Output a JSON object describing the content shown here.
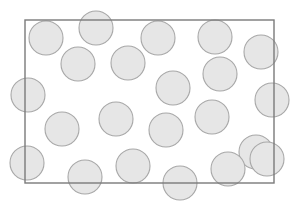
{
  "figure": {
    "name": "circle-field-with-rectangular-sampling-frame",
    "background_color": "#ffffff",
    "width": 299,
    "height": 204
  },
  "frame": {
    "label": "sampling-frame",
    "x": 25,
    "y": 20,
    "width": 249,
    "height": 163,
    "stroke_color": "#7a7a7a",
    "stroke_width": 1.4,
    "fill": "none"
  },
  "circle_style": {
    "fill_color": "#e6e6e6",
    "stroke_color": "#a8a8a8",
    "stroke_width": 1.1,
    "radius": 17
  },
  "chart_data": {
    "type": "scatter",
    "title": "",
    "subtitle": "",
    "xlabel": "",
    "ylabel": "",
    "xlim": [
      0,
      299
    ],
    "ylim": [
      0,
      204
    ],
    "grid": false,
    "legend": null,
    "annotations": [],
    "marker": "circle",
    "marker_radius": 17,
    "marker_fill": "#e6e6e6",
    "marker_stroke": "#a8a8a8",
    "overlay_shape": {
      "type": "rectangle",
      "x": 25,
      "y": 20,
      "width": 249,
      "height": 163,
      "stroke": "#7a7a7a"
    },
    "n_points": 22,
    "x": [
      46,
      96,
      158,
      215,
      261,
      28,
      78,
      128,
      173,
      220,
      272,
      62,
      116,
      166,
      212,
      256,
      27,
      85,
      133,
      180,
      228,
      267
    ],
    "y": [
      38,
      28,
      38,
      37,
      52,
      95,
      64,
      63,
      88,
      74,
      100,
      129,
      119,
      130,
      117,
      152,
      163,
      177,
      166,
      183,
      169,
      159
    ],
    "points": [
      {
        "cx": 46,
        "cy": 38,
        "r": 17
      },
      {
        "cx": 96,
        "cy": 28,
        "r": 17
      },
      {
        "cx": 158,
        "cy": 38,
        "r": 17
      },
      {
        "cx": 215,
        "cy": 37,
        "r": 17
      },
      {
        "cx": 261,
        "cy": 52,
        "r": 17
      },
      {
        "cx": 28,
        "cy": 95,
        "r": 17
      },
      {
        "cx": 78,
        "cy": 64,
        "r": 17
      },
      {
        "cx": 128,
        "cy": 63,
        "r": 17
      },
      {
        "cx": 173,
        "cy": 88,
        "r": 17
      },
      {
        "cx": 220,
        "cy": 74,
        "r": 17
      },
      {
        "cx": 272,
        "cy": 100,
        "r": 17
      },
      {
        "cx": 62,
        "cy": 129,
        "r": 17
      },
      {
        "cx": 116,
        "cy": 119,
        "r": 17
      },
      {
        "cx": 166,
        "cy": 130,
        "r": 17
      },
      {
        "cx": 212,
        "cy": 117,
        "r": 17
      },
      {
        "cx": 256,
        "cy": 152,
        "r": 17
      },
      {
        "cx": 27,
        "cy": 163,
        "r": 17
      },
      {
        "cx": 85,
        "cy": 177,
        "r": 17
      },
      {
        "cx": 133,
        "cy": 166,
        "r": 17
      },
      {
        "cx": 180,
        "cy": 183,
        "r": 17
      },
      {
        "cx": 228,
        "cy": 169,
        "r": 17
      },
      {
        "cx": 267,
        "cy": 159,
        "r": 17
      }
    ]
  }
}
